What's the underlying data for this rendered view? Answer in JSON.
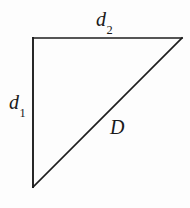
{
  "figure": {
    "name": "right-triangle-distance-diagram",
    "background_color": "#fdfdfd",
    "stroke_color": "#1d1d1d",
    "canvas": {
      "width": 190,
      "height": 208
    },
    "shape": {
      "type": "right-triangle",
      "vertices": {
        "top_left": {
          "x": 33,
          "y": 38
        },
        "top_right": {
          "x": 182,
          "y": 38
        },
        "bottom_left": {
          "x": 33,
          "y": 187
        }
      },
      "edges": [
        {
          "name": "top-edge",
          "from": "top_left",
          "to": "top_right",
          "label": "d2"
        },
        {
          "name": "left-edge",
          "from": "top_left",
          "to": "bottom_left",
          "label": "d1"
        },
        {
          "name": "hypotenuse",
          "from": "bottom_left",
          "to": "top_right",
          "label": "D"
        }
      ]
    },
    "labels": {
      "d2": {
        "base": "d",
        "subscript": "2"
      },
      "d1": {
        "base": "d",
        "subscript": "1"
      },
      "D": {
        "base": "D",
        "subscript": ""
      }
    }
  }
}
